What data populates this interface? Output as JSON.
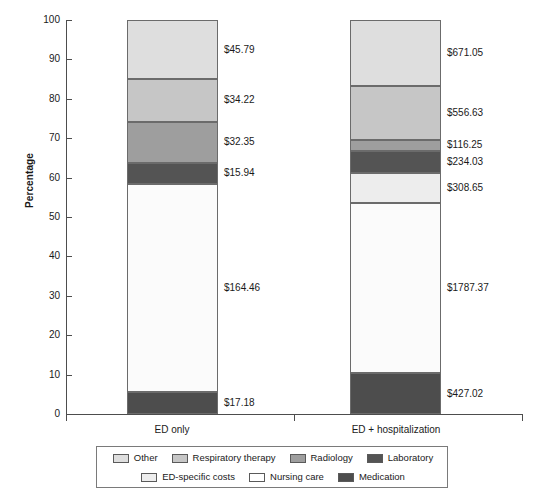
{
  "chart_data": {
    "type": "bar",
    "subtype": "stacked-bar-100-percent",
    "title": "",
    "xlabel": "",
    "ylabel": "Percentage",
    "ylim": [
      0,
      100
    ],
    "ytick_labels": [
      "0",
      "10",
      "20",
      "30",
      "40",
      "50",
      "60",
      "70",
      "80",
      "90",
      "100"
    ],
    "ytick_values": [
      0,
      10,
      20,
      30,
      40,
      50,
      60,
      70,
      80,
      90,
      100
    ],
    "grid": false,
    "legend_position": "bottom",
    "categories": [
      "ED only",
      "ED + hospitalization"
    ],
    "series": [
      {
        "name": "Medication",
        "color": "#4d4d4d",
        "values": [
          5.5,
          10.4
        ],
        "labels": [
          "$17.18",
          "$427.02"
        ]
      },
      {
        "name": "Nursing care",
        "color": "#fbfbfb",
        "values": [
          53.0,
          43.2
        ],
        "labels": [
          "$164.46",
          "$1787.37"
        ]
      },
      {
        "name": "ED-specific costs",
        "color": "#ededed",
        "values": [
          0,
          7.5
        ],
        "labels": [
          "",
          "$308.65"
        ]
      },
      {
        "name": "Laboratory",
        "color": "#545454",
        "values": [
          5.2,
          5.7
        ],
        "labels": [
          "$15.94",
          "$234.03"
        ]
      },
      {
        "name": "Radiology",
        "color": "#9e9e9e",
        "values": [
          10.5,
          2.8
        ],
        "labels": [
          "$32.35",
          "$116.25"
        ]
      },
      {
        "name": "Respiratory therapy",
        "color": "#c6c6c6",
        "values": [
          10.8,
          13.6
        ],
        "labels": [
          "$34.22",
          "$556.63"
        ]
      },
      {
        "name": "Other",
        "color": "#dedede",
        "values": [
          15.0,
          16.8
        ],
        "labels": [
          "$45.79",
          "$671.05"
        ]
      }
    ],
    "legend_entries": [
      {
        "label": "Other",
        "color": "#dedede"
      },
      {
        "label": "Respiratory therapy",
        "color": "#c6c6c6"
      },
      {
        "label": "Radiology",
        "color": "#9e9e9e"
      },
      {
        "label": "Laboratory",
        "color": "#545454"
      },
      {
        "label": "ED-specific costs",
        "color": "#ededed"
      },
      {
        "label": "Nursing care",
        "color": "#ffffff"
      },
      {
        "label": "Medication",
        "color": "#4d4d4d"
      }
    ]
  },
  "axis": {
    "y_title": "Percentage",
    "y_ticks": [
      "100",
      "90",
      "80",
      "70",
      "60",
      "50",
      "40",
      "30",
      "20",
      "10",
      "0"
    ],
    "x_categories": [
      "ED only",
      "ED + hospitalization"
    ]
  },
  "bars": {
    "left": {
      "category": "ED only",
      "segments": [
        {
          "name": "Other",
          "value_label": "$45.79",
          "pct": 15.0
        },
        {
          "name": "Respiratory therapy",
          "value_label": "$34.22",
          "pct": 10.8
        },
        {
          "name": "Radiology",
          "value_label": "$32.35",
          "pct": 10.5
        },
        {
          "name": "Laboratory",
          "value_label": "$15.94",
          "pct": 5.2
        },
        {
          "name": "Nursing care",
          "value_label": "$164.46",
          "pct": 53.0
        },
        {
          "name": "Medication",
          "value_label": "$17.18",
          "pct": 5.5
        }
      ]
    },
    "right": {
      "category": "ED + hospitalization",
      "segments": [
        {
          "name": "Other",
          "value_label": "$671.05",
          "pct": 16.8
        },
        {
          "name": "Respiratory therapy",
          "value_label": "$556.63",
          "pct": 13.6
        },
        {
          "name": "Radiology",
          "value_label": "$116.25",
          "pct": 2.8
        },
        {
          "name": "Laboratory",
          "value_label": "$234.03",
          "pct": 5.7
        },
        {
          "name": "ED-specific costs",
          "value_label": "$308.65",
          "pct": 7.5
        },
        {
          "name": "Nursing care",
          "value_label": "$1787.37",
          "pct": 43.2
        },
        {
          "name": "Medication",
          "value_label": "$427.02",
          "pct": 10.4
        }
      ]
    }
  }
}
